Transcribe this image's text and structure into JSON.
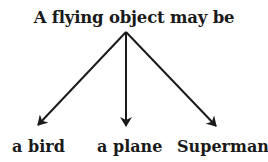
{
  "diagram": {
    "title": "A flying object may be",
    "children": [
      {
        "label": "a bird"
      },
      {
        "label": "a plane"
      },
      {
        "label": "Superman"
      }
    ],
    "line_color": "#1a1a1a"
  }
}
